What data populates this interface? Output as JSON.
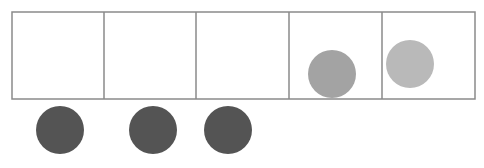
{
  "diagram": {
    "grid": {
      "cells": 5,
      "x": 12,
      "y": 12,
      "width": 463,
      "height": 87,
      "dividers_x": [
        104,
        196,
        289,
        382
      ],
      "stroke_color": "#8a8a8a"
    },
    "circles": [
      {
        "id": "cell4-counter",
        "cx": 332,
        "cy": 74,
        "r": 24,
        "fill": "#a3a3a3",
        "location": "cell 4"
      },
      {
        "id": "cell5-counter",
        "cx": 410,
        "cy": 64,
        "r": 24,
        "fill": "#b9b9b9",
        "location": "cell 5"
      },
      {
        "id": "below-counter-1",
        "cx": 60,
        "cy": 130,
        "r": 24,
        "fill": "#545454",
        "location": "below cell 1"
      },
      {
        "id": "below-counter-2",
        "cx": 153,
        "cy": 130,
        "r": 24,
        "fill": "#545454",
        "location": "below cell 2"
      },
      {
        "id": "below-counter-3",
        "cx": 228,
        "cy": 130,
        "r": 24,
        "fill": "#545454",
        "location": "below cell 3"
      }
    ]
  }
}
